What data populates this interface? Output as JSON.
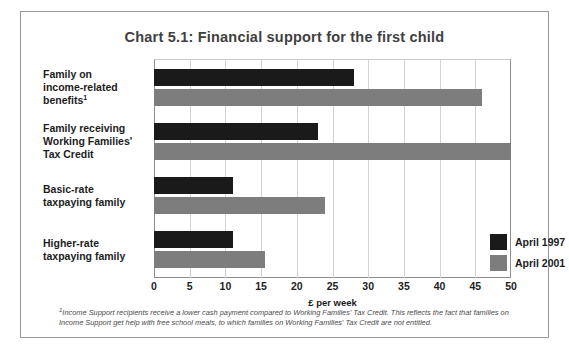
{
  "chart_data": {
    "type": "bar",
    "orientation": "horizontal",
    "title": "Chart 5.1: Financial support for the first child",
    "xlabel": "£ per week",
    "ylabel": "",
    "xlim": [
      0,
      50
    ],
    "xticks": [
      0,
      5,
      10,
      15,
      20,
      25,
      30,
      35,
      40,
      45,
      50
    ],
    "xtick_labels": [
      "0",
      "5",
      "10",
      "15",
      "20",
      "25",
      "30",
      "35",
      "40",
      "45",
      "50"
    ],
    "grid": true,
    "legend_position": "inside-right",
    "categories": [
      "Family on income-related benefits",
      "Family receiving Working Families' Tax Credit",
      "Basic-rate taxpaying family",
      "Higher-rate taxpaying family"
    ],
    "category_lines": [
      [
        "Family on",
        "income-related",
        "benefits"
      ],
      [
        "Family receiving",
        "Working Families'",
        "Tax Credit"
      ],
      [
        "Basic-rate",
        "taxpaying family"
      ],
      [
        "Higher-rate",
        "taxpaying family"
      ]
    ],
    "category_footnote_markers": [
      "1",
      "",
      "",
      ""
    ],
    "series": [
      {
        "name": "April 1997",
        "color": "#1a1a1a",
        "values": [
          28,
          23,
          11,
          11
        ]
      },
      {
        "name": "April 2001",
        "color": "#7d7d7d",
        "values": [
          46,
          50,
          24,
          15.5
        ]
      }
    ]
  },
  "footnote": {
    "marker": "1",
    "text": "Income Support recipients receive a lower cash payment compared to Working Families' Tax Credit. This reflects the fact that families on Income Support get help with free school meals, to which families on Working Families' Tax Credit are not entitled."
  }
}
